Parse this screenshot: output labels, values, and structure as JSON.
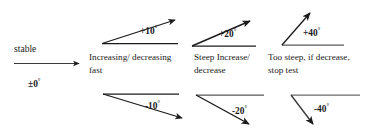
{
  "figure": {
    "type": "diagram",
    "background_color": "#ffffff",
    "stroke_color": "#1b1b1b",
    "text_color": "#1b1b1b"
  },
  "columns": [
    {
      "id": "stable",
      "caption": "stable",
      "angle_label": "±0",
      "degree_symbol": "°",
      "angle_value": 0,
      "arrows": [
        {
          "id": "zero-arrow",
          "angle_deg": 0,
          "direction": "right"
        }
      ]
    },
    {
      "id": "moderate",
      "caption_line1": "Increasing/ decreasing",
      "caption_line2": "fast",
      "arrows": [
        {
          "id": "plus-10-arrow",
          "label": "+10",
          "degree_symbol": "°",
          "angle_value": 10,
          "direction": "up"
        },
        {
          "id": "minus-10-arrow",
          "label": "-10",
          "degree_symbol": "°",
          "angle_value": -10,
          "direction": "down"
        }
      ]
    },
    {
      "id": "steep",
      "caption_line1": "Steep Increase/",
      "caption_line2": "decrease",
      "arrows": [
        {
          "id": "plus-20-arrow",
          "label": "+20",
          "degree_symbol": "°",
          "angle_value": 20,
          "direction": "up"
        },
        {
          "id": "minus-20-arrow",
          "label": "-20",
          "degree_symbol": "°",
          "angle_value": -20,
          "direction": "down"
        }
      ]
    },
    {
      "id": "too-steep",
      "caption_line1": "Too steep, if decrease,",
      "caption_line2": "stop test",
      "arrows": [
        {
          "id": "plus-40-arrow",
          "label": "+40",
          "degree_symbol": "°",
          "angle_value": 40,
          "direction": "up"
        },
        {
          "id": "minus-40-arrow",
          "label": "-40",
          "degree_symbol": "°",
          "angle_value": -40,
          "direction": "down"
        }
      ]
    }
  ]
}
